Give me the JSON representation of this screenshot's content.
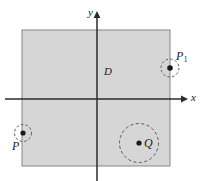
{
  "figure": {
    "background_color": "#ffffff",
    "region_fill_color": "#d6d6d6",
    "region_border_color": "#8c8c8c",
    "axis_color": "#2b2b2b",
    "dashed_circle_color": "#5a5a5a",
    "point_color": "#1a1a1a"
  },
  "axes": {
    "x_label": "x",
    "y_label": "y",
    "origin": {
      "x": 97,
      "y": 99
    },
    "x_axis": {
      "start_x": 5,
      "end_x": 183,
      "y": 99,
      "arrow": "right"
    },
    "y_axis": {
      "x": 97,
      "start_y": 181,
      "end_y": 16,
      "arrow": "up"
    }
  },
  "region": {
    "label": "D",
    "label_position": {
      "x": 104,
      "y": 66
    },
    "rect": {
      "x": 22,
      "y": 30,
      "width": 148,
      "height": 136
    }
  },
  "points": [
    {
      "id": "P",
      "label": "P",
      "label_position": {
        "x": 12,
        "y": 140
      },
      "center": {
        "x": 23,
        "y": 133
      },
      "dot_radius": 2.6,
      "circle_radius": 8.5,
      "circle_style": "dashed",
      "location": "outside-region"
    },
    {
      "id": "P1",
      "label": "P",
      "subscript": "1",
      "label_position": {
        "x": 176,
        "y": 50
      },
      "center": {
        "x": 170,
        "y": 68
      },
      "dot_radius": 2.8,
      "circle_radius": 9,
      "circle_style": "dashed",
      "location": "on-boundary"
    },
    {
      "id": "Q",
      "label": "Q",
      "label_position": {
        "x": 144,
        "y": 145
      },
      "center": {
        "x": 139,
        "y": 143
      },
      "dot_radius": 2.6,
      "circle_radius": 19.5,
      "circle_style": "dashed",
      "location": "inside-region"
    }
  ]
}
